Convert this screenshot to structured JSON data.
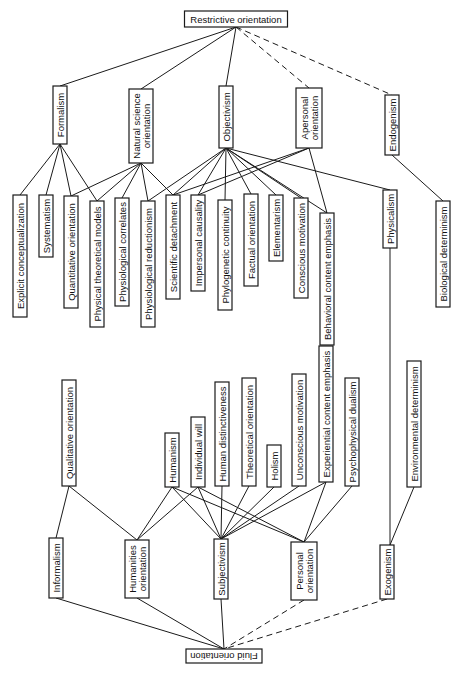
{
  "diagram": {
    "type": "hierarchy",
    "top_root": "Restrictive orientation",
    "bottom_root": "Fluid orientation",
    "nodes": [
      {
        "id": "restrictive",
        "label": "Restrictive orientation",
        "lines": [
          "Restrictive orientation"
        ],
        "x": 236,
        "y": 19,
        "w": 103,
        "h": 16,
        "rot": 0
      },
      {
        "id": "formalism",
        "label": "Formalism",
        "lines": [
          "Formalism"
        ],
        "x": 60,
        "y": 115,
        "w": 14,
        "h": 58,
        "rot": -90
      },
      {
        "id": "natsci",
        "label": "Natural science orientation",
        "lines": [
          "Natural science",
          "orientation"
        ],
        "x": 141,
        "y": 126,
        "w": 24,
        "h": 74,
        "rot": -90
      },
      {
        "id": "objectivism",
        "label": "Objectivism",
        "lines": [
          "Objectivism"
        ],
        "x": 226,
        "y": 117,
        "w": 14,
        "h": 62,
        "rot": -90
      },
      {
        "id": "apersonal",
        "label": "Apersonal orientation",
        "lines": [
          "Apersonal",
          "orientation"
        ],
        "x": 309,
        "y": 118,
        "w": 26,
        "h": 60,
        "rot": -90
      },
      {
        "id": "endogenism",
        "label": "Endogenism",
        "lines": [
          "Endogenism"
        ],
        "x": 392,
        "y": 125,
        "w": 14,
        "h": 60,
        "rot": -90
      },
      {
        "id": "explicit",
        "label": "Explicit conceptualization",
        "lines": [
          "Explicit conceptualization"
        ],
        "x": 20,
        "y": 256,
        "w": 14,
        "h": 122,
        "rot": -90
      },
      {
        "id": "systematism",
        "label": "Systematism",
        "lines": [
          "Systematism"
        ],
        "x": 46,
        "y": 226,
        "w": 14,
        "h": 62,
        "rot": -90
      },
      {
        "id": "quantitative",
        "label": "Quantitative orientation",
        "lines": [
          "Quantitative orientation"
        ],
        "x": 71,
        "y": 252,
        "w": 14,
        "h": 112,
        "rot": -90
      },
      {
        "id": "physmodels",
        "label": "Physical theoretical models",
        "lines": [
          "Physical theoretical models"
        ],
        "x": 97,
        "y": 264,
        "w": 14,
        "h": 126,
        "rot": -90
      },
      {
        "id": "physcorr",
        "label": "Physiological correlates",
        "lines": [
          "Physiological correlates"
        ],
        "x": 122,
        "y": 252,
        "w": 14,
        "h": 108,
        "rot": -90
      },
      {
        "id": "physred",
        "label": "Physiological reductionism",
        "lines": [
          "Physiological reductionism"
        ],
        "x": 148,
        "y": 264,
        "w": 14,
        "h": 126,
        "rot": -90
      },
      {
        "id": "scidet",
        "label": "Scientific detachment",
        "lines": [
          "Scientific detachment"
        ],
        "x": 173,
        "y": 247,
        "w": 14,
        "h": 104,
        "rot": -90
      },
      {
        "id": "impcaus",
        "label": "Impersonal causality",
        "lines": [
          "Impersonal causality"
        ],
        "x": 198,
        "y": 243,
        "w": 14,
        "h": 96,
        "rot": -90
      },
      {
        "id": "phylo",
        "label": "Phylogenetic continuity",
        "lines": [
          "Phylogenetic continuity"
        ],
        "x": 225,
        "y": 255,
        "w": 14,
        "h": 110,
        "rot": -90
      },
      {
        "id": "factual",
        "label": "Factual orientation",
        "lines": [
          "Factual orientation"
        ],
        "x": 251,
        "y": 240,
        "w": 14,
        "h": 92,
        "rot": -90
      },
      {
        "id": "elementarism",
        "label": "Elementarism",
        "lines": [
          "Elementarism"
        ],
        "x": 276,
        "y": 228,
        "w": 14,
        "h": 66,
        "rot": -90
      },
      {
        "id": "consmot",
        "label": "Conscious motivation",
        "lines": [
          "Conscious motivation"
        ],
        "x": 301,
        "y": 248,
        "w": 14,
        "h": 100,
        "rot": -90
      },
      {
        "id": "behav",
        "label": "Behavioral content emphasis",
        "lines": [
          "Behavioral content emphasis"
        ],
        "x": 327,
        "y": 279,
        "w": 14,
        "h": 132,
        "rot": -90
      },
      {
        "id": "physicalism",
        "label": "Physicalism",
        "lines": [
          "Physicalism"
        ],
        "x": 390,
        "y": 219,
        "w": 14,
        "h": 58,
        "rot": -90
      },
      {
        "id": "biodet",
        "label": "Biological determinism",
        "lines": [
          "Biological determinism"
        ],
        "x": 443,
        "y": 254,
        "w": 14,
        "h": 106,
        "rot": -90
      },
      {
        "id": "qualitative",
        "label": "Qualitative orientation",
        "lines": [
          "Qualitative orientation"
        ],
        "x": 69,
        "y": 433,
        "w": 14,
        "h": 106,
        "rot": -90
      },
      {
        "id": "humanism",
        "label": "Humanism",
        "lines": [
          "Humanism"
        ],
        "x": 172,
        "y": 460,
        "w": 14,
        "h": 54,
        "rot": -90
      },
      {
        "id": "indwill",
        "label": "Individual will",
        "lines": [
          "Individual will"
        ],
        "x": 198,
        "y": 452,
        "w": 14,
        "h": 70,
        "rot": -90
      },
      {
        "id": "humdist",
        "label": "Human distinctiveness",
        "lines": [
          "Human distinctiveness"
        ],
        "x": 222,
        "y": 434,
        "w": 14,
        "h": 104,
        "rot": -90
      },
      {
        "id": "theoretical",
        "label": "Theoretical orientation",
        "lines": [
          "Theoretical orientation"
        ],
        "x": 249,
        "y": 432,
        "w": 14,
        "h": 108,
        "rot": -90
      },
      {
        "id": "holism",
        "label": "Holism",
        "lines": [
          "Holism"
        ],
        "x": 274,
        "y": 466,
        "w": 14,
        "h": 42,
        "rot": -90
      },
      {
        "id": "uncmot",
        "label": "Unconscious motivation",
        "lines": [
          "Unconscious motivation"
        ],
        "x": 299,
        "y": 430,
        "w": 14,
        "h": 112,
        "rot": -90
      },
      {
        "id": "experiential",
        "label": "Experiential content emphasis",
        "lines": [
          "Experiential content emphasis"
        ],
        "x": 326,
        "y": 414,
        "w": 14,
        "h": 136,
        "rot": -90
      },
      {
        "id": "psychodual",
        "label": "Psychophysical dualism",
        "lines": [
          "Psychophysical dualism"
        ],
        "x": 352,
        "y": 432,
        "w": 14,
        "h": 108,
        "rot": -90
      },
      {
        "id": "envdet",
        "label": "Environmental determinism",
        "lines": [
          "Environmental determinism"
        ],
        "x": 414,
        "y": 424,
        "w": 14,
        "h": 126,
        "rot": -90
      },
      {
        "id": "informalism",
        "label": "Informalism",
        "lines": [
          "Informalism"
        ],
        "x": 56,
        "y": 568,
        "w": 14,
        "h": 60,
        "rot": -90
      },
      {
        "id": "humanities",
        "label": "Humanities orientation",
        "lines": [
          "Humanities",
          "orientation"
        ],
        "x": 137,
        "y": 569,
        "w": 24,
        "h": 58,
        "rot": -90
      },
      {
        "id": "subjectivism",
        "label": "Subjectivism",
        "lines": [
          "Subjectivism"
        ],
        "x": 221,
        "y": 569,
        "w": 14,
        "h": 60,
        "rot": -90
      },
      {
        "id": "personal",
        "label": "Personal orientation",
        "lines": [
          "Personal",
          "orientation"
        ],
        "x": 304,
        "y": 571,
        "w": 26,
        "h": 58,
        "rot": -90
      },
      {
        "id": "exogenism",
        "label": "Exogenism",
        "lines": [
          "Exogenism"
        ],
        "x": 387,
        "y": 572,
        "w": 14,
        "h": 54,
        "rot": -90
      },
      {
        "id": "fluid",
        "label": "Fluid orientation",
        "lines": [
          "Fluid orientation"
        ],
        "x": 224,
        "y": 656,
        "w": 76,
        "h": 14,
        "rot": 180
      }
    ],
    "edges": [
      {
        "from": [
          236,
          27
        ],
        "to": [
          60,
          86
        ],
        "style": "solid"
      },
      {
        "from": [
          236,
          27
        ],
        "to": [
          141,
          89
        ],
        "style": "solid"
      },
      {
        "from": [
          236,
          27
        ],
        "to": [
          226,
          86
        ],
        "style": "solid"
      },
      {
        "from": [
          236,
          27
        ],
        "to": [
          309,
          88
        ],
        "style": "dashed"
      },
      {
        "from": [
          236,
          27
        ],
        "to": [
          392,
          95
        ],
        "style": "dashed"
      },
      {
        "from": [
          60,
          144
        ],
        "to": [
          20,
          195
        ],
        "style": "solid"
      },
      {
        "from": [
          60,
          144
        ],
        "to": [
          46,
          195
        ],
        "style": "solid"
      },
      {
        "from": [
          60,
          144
        ],
        "to": [
          71,
          196
        ],
        "style": "solid"
      },
      {
        "from": [
          60,
          144
        ],
        "to": [
          97,
          201
        ],
        "style": "solid"
      },
      {
        "from": [
          141,
          163
        ],
        "to": [
          71,
          196
        ],
        "style": "solid"
      },
      {
        "from": [
          141,
          163
        ],
        "to": [
          97,
          201
        ],
        "style": "solid"
      },
      {
        "from": [
          141,
          163
        ],
        "to": [
          122,
          198
        ],
        "style": "solid"
      },
      {
        "from": [
          141,
          163
        ],
        "to": [
          148,
          201
        ],
        "style": "solid"
      },
      {
        "from": [
          141,
          163
        ],
        "to": [
          173,
          195
        ],
        "style": "solid"
      },
      {
        "from": [
          226,
          148
        ],
        "to": [
          148,
          201
        ],
        "style": "solid"
      },
      {
        "from": [
          226,
          148
        ],
        "to": [
          173,
          195
        ],
        "style": "solid"
      },
      {
        "from": [
          226,
          148
        ],
        "to": [
          198,
          195
        ],
        "style": "solid"
      },
      {
        "from": [
          226,
          148
        ],
        "to": [
          225,
          200
        ],
        "style": "solid"
      },
      {
        "from": [
          226,
          148
        ],
        "to": [
          251,
          194
        ],
        "style": "solid"
      },
      {
        "from": [
          226,
          148
        ],
        "to": [
          276,
          195
        ],
        "style": "solid"
      },
      {
        "from": [
          226,
          148
        ],
        "to": [
          301,
          198
        ],
        "style": "solid"
      },
      {
        "from": [
          226,
          148
        ],
        "to": [
          327,
          213
        ],
        "style": "solid"
      },
      {
        "from": [
          226,
          148
        ],
        "to": [
          390,
          190
        ],
        "style": "solid"
      },
      {
        "from": [
          309,
          148
        ],
        "to": [
          173,
          195
        ],
        "style": "solid"
      },
      {
        "from": [
          309,
          148
        ],
        "to": [
          198,
          195
        ],
        "style": "solid"
      },
      {
        "from": [
          309,
          148
        ],
        "to": [
          327,
          213
        ],
        "style": "solid"
      },
      {
        "from": [
          392,
          155
        ],
        "to": [
          443,
          201
        ],
        "style": "solid"
      },
      {
        "from": [
          390,
          248
        ],
        "to": [
          390,
          545
        ],
        "style": "solid"
      },
      {
        "from": [
          69,
          486
        ],
        "to": [
          56,
          538
        ],
        "style": "solid"
      },
      {
        "from": [
          69,
          486
        ],
        "to": [
          137,
          540
        ],
        "style": "solid"
      },
      {
        "from": [
          172,
          487
        ],
        "to": [
          137,
          540
        ],
        "style": "solid"
      },
      {
        "from": [
          198,
          487
        ],
        "to": [
          137,
          540
        ],
        "style": "solid"
      },
      {
        "from": [
          172,
          487
        ],
        "to": [
          221,
          539
        ],
        "style": "solid"
      },
      {
        "from": [
          198,
          487
        ],
        "to": [
          221,
          539
        ],
        "style": "solid"
      },
      {
        "from": [
          222,
          486
        ],
        "to": [
          221,
          539
        ],
        "style": "solid"
      },
      {
        "from": [
          249,
          486
        ],
        "to": [
          221,
          539
        ],
        "style": "solid"
      },
      {
        "from": [
          274,
          487
        ],
        "to": [
          221,
          539
        ],
        "style": "solid"
      },
      {
        "from": [
          299,
          486
        ],
        "to": [
          221,
          539
        ],
        "style": "solid"
      },
      {
        "from": [
          326,
          482
        ],
        "to": [
          221,
          539
        ],
        "style": "solid"
      },
      {
        "from": [
          172,
          487
        ],
        "to": [
          304,
          542
        ],
        "style": "solid"
      },
      {
        "from": [
          198,
          487
        ],
        "to": [
          304,
          542
        ],
        "style": "solid"
      },
      {
        "from": [
          326,
          482
        ],
        "to": [
          304,
          542
        ],
        "style": "solid"
      },
      {
        "from": [
          352,
          486
        ],
        "to": [
          304,
          542
        ],
        "style": "solid"
      },
      {
        "from": [
          414,
          487
        ],
        "to": [
          390,
          545
        ],
        "style": "solid"
      },
      {
        "from": [
          56,
          598
        ],
        "to": [
          224,
          649
        ],
        "style": "solid"
      },
      {
        "from": [
          137,
          598
        ],
        "to": [
          224,
          649
        ],
        "style": "solid"
      },
      {
        "from": [
          221,
          599
        ],
        "to": [
          224,
          649
        ],
        "style": "solid"
      },
      {
        "from": [
          304,
          600
        ],
        "to": [
          224,
          649
        ],
        "style": "dashed"
      },
      {
        "from": [
          387,
          599
        ],
        "to": [
          224,
          649
        ],
        "style": "dashed"
      }
    ]
  }
}
